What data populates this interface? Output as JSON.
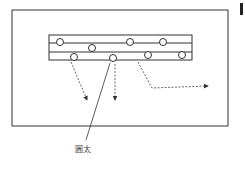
{
  "diagram": {
    "label_log": "圓太",
    "colors": {
      "stroke": "#333333",
      "dashed": "#444444",
      "background": "#ffffff"
    },
    "outer_frame": {
      "x": 12,
      "y": 10,
      "w": 216,
      "h": 116
    },
    "rack": {
      "x": 49,
      "y": 35,
      "w": 143,
      "h": 25,
      "divider_ys": [
        43,
        52
      ]
    },
    "logs": [
      {
        "cx": 60,
        "cy": 42
      },
      {
        "cx": 92,
        "cy": 48
      },
      {
        "cx": 130,
        "cy": 42
      },
      {
        "cx": 163,
        "cy": 42
      },
      {
        "cx": 74,
        "cy": 57
      },
      {
        "cx": 113,
        "cy": 58
      },
      {
        "cx": 148,
        "cy": 55
      },
      {
        "cx": 182,
        "cy": 55
      }
    ],
    "arrows": [
      {
        "name": "arrow-down-left",
        "points": "71,62 87,100"
      },
      {
        "name": "arrow-down-center",
        "points": "115,64 115,100"
      },
      {
        "name": "arrow-right",
        "points": "138,62 152,88 208,86"
      }
    ],
    "leader_line": {
      "x1": 110,
      "y1": 63,
      "x2": 86,
      "y2": 140
    },
    "label_position": {
      "x": 75,
      "y": 146
    }
  }
}
